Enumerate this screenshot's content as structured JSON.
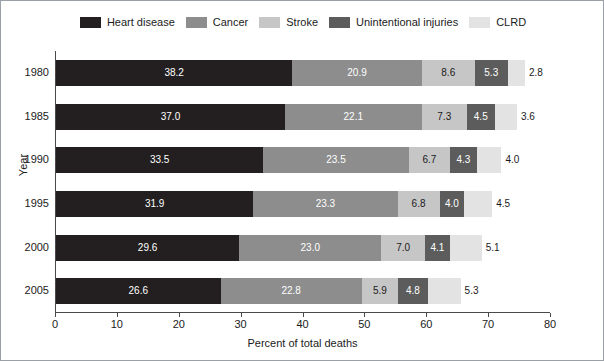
{
  "chart_data": {
    "type": "bar",
    "orientation": "horizontal",
    "stacked": true,
    "title": "",
    "xlabel": "Percent of total deaths",
    "ylabel": "Year",
    "xlim": [
      0,
      80
    ],
    "xticks": [
      0,
      10,
      20,
      30,
      40,
      50,
      60,
      70,
      80
    ],
    "grid": false,
    "legend_position": "top",
    "categories": [
      "1980",
      "1985",
      "1990",
      "1995",
      "2000",
      "2005"
    ],
    "series": [
      {
        "name": "Heart disease",
        "color": "#231f20",
        "label_color": "on-dark",
        "values": [
          38.2,
          37.0,
          33.5,
          31.9,
          29.6,
          26.6
        ],
        "labels": [
          "38.2",
          "37.0",
          "33.5",
          "31.9",
          "29.6",
          "26.6"
        ]
      },
      {
        "name": "Cancer",
        "color": "#8d8d8d",
        "label_color": "on-dark",
        "values": [
          20.9,
          22.1,
          23.5,
          23.3,
          23.0,
          22.8
        ],
        "labels": [
          "20.9",
          "22.1",
          "23.5",
          "23.3",
          "23.0",
          "22.8"
        ]
      },
      {
        "name": "Stroke",
        "color": "#c6c6c6",
        "label_color": "on-light",
        "values": [
          8.6,
          7.3,
          6.7,
          6.8,
          7.0,
          5.9
        ],
        "labels": [
          "8.6",
          "7.3",
          "6.7",
          "6.8",
          "7.0",
          "5.9"
        ]
      },
      {
        "name": "Unintentional injuries",
        "color": "#5c5c5c",
        "label_color": "on-dark",
        "values": [
          5.3,
          4.5,
          4.3,
          4.0,
          4.1,
          4.8
        ],
        "labels": [
          "5.3",
          "4.5",
          "4.3",
          "4.0",
          "4.1",
          "4.8"
        ]
      },
      {
        "name": "CLRD",
        "color": "#e3e3e3",
        "label_color": "on-light",
        "values": [
          2.8,
          3.6,
          4.0,
          4.5,
          5.1,
          5.3
        ],
        "labels": [
          "2.8",
          "3.6",
          "4.0",
          "4.5",
          "5.1",
          "5.3"
        ]
      }
    ]
  },
  "legend": {
    "items": [
      {
        "label": "Heart disease",
        "color": "#231f20"
      },
      {
        "label": "Cancer",
        "color": "#8d8d8d"
      },
      {
        "label": "Stroke",
        "color": "#c6c6c6"
      },
      {
        "label": "Unintentional injuries",
        "color": "#5c5c5c"
      },
      {
        "label": "CLRD",
        "color": "#e3e3e3"
      }
    ]
  },
  "axes": {
    "x": {
      "title": "Percent of total deaths",
      "tick_labels": [
        "0",
        "10",
        "20",
        "30",
        "40",
        "50",
        "60",
        "70",
        "80"
      ]
    },
    "y": {
      "title": "Year",
      "tick_labels": [
        "1980",
        "1985",
        "1990",
        "1995",
        "2000",
        "2005"
      ]
    }
  }
}
